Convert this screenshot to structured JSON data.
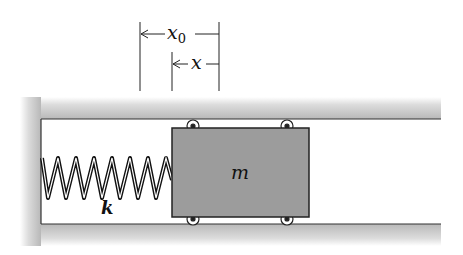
{
  "diagram": {
    "labels": {
      "displacement_total": "x",
      "displacement_total_sub": "0",
      "displacement": "x",
      "spring": "k",
      "mass": "m"
    },
    "colors": {
      "wall": "#c8c8c8",
      "block": "#9a9a9a",
      "outline": "#222222",
      "background": "#ffffff"
    },
    "components": [
      "channel-walls",
      "spring",
      "mass-block",
      "rollers",
      "dimension-x0",
      "dimension-x"
    ]
  }
}
